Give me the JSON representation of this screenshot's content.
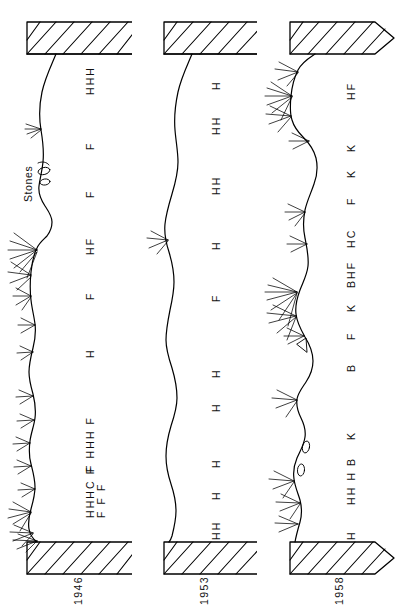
{
  "figure": {
    "orientation": "rotated-90",
    "annotation": "Stones",
    "line_color": "#000000",
    "background": "#ffffff"
  },
  "panels": [
    {
      "id": "panel-1946",
      "year": "1946",
      "block_arrow": false,
      "codes": [
        "HHH",
        "F",
        "F",
        "HF",
        "F",
        "H",
        "F HHH F",
        "HHHC F",
        "F F F",
        "H"
      ],
      "code_rows": [
        {
          "row": "outer",
          "labels": [
            "HHH",
            "F",
            "F",
            "H",
            "F",
            "F",
            "H",
            "F",
            "HHH",
            "F",
            "C",
            "H",
            "H",
            "H",
            "F"
          ]
        },
        {
          "row": "inner",
          "labels": [
            "F",
            "F",
            "F"
          ]
        }
      ]
    },
    {
      "id": "panel-1953",
      "year": "1953",
      "block_arrow": false,
      "codes": [
        "H",
        "HH",
        "HH",
        "H",
        "F",
        "H",
        "H",
        "H",
        "H",
        "HH"
      ],
      "code_rows": [
        {
          "row": "outer",
          "labels": [
            "H",
            "HH",
            "HH",
            "H",
            "F",
            "H",
            "H",
            "H",
            "H",
            "H",
            "H"
          ]
        }
      ]
    },
    {
      "id": "panel-1958",
      "year": "1958",
      "block_arrow": true,
      "codes": [
        "HF",
        "K",
        "K",
        "F",
        "HC",
        "BHF",
        "K",
        "F",
        "B",
        "K",
        "HH H B",
        "H"
      ],
      "code_rows": [
        {
          "row": "outer",
          "labels": [
            "HF",
            "K",
            "K",
            "F",
            "HC",
            "BHF",
            "K",
            "F",
            "B",
            "K",
            "HH",
            "H",
            "B",
            "H"
          ]
        }
      ]
    }
  ],
  "legend_codes": [
    "H",
    "F",
    "C",
    "K",
    "B"
  ]
}
